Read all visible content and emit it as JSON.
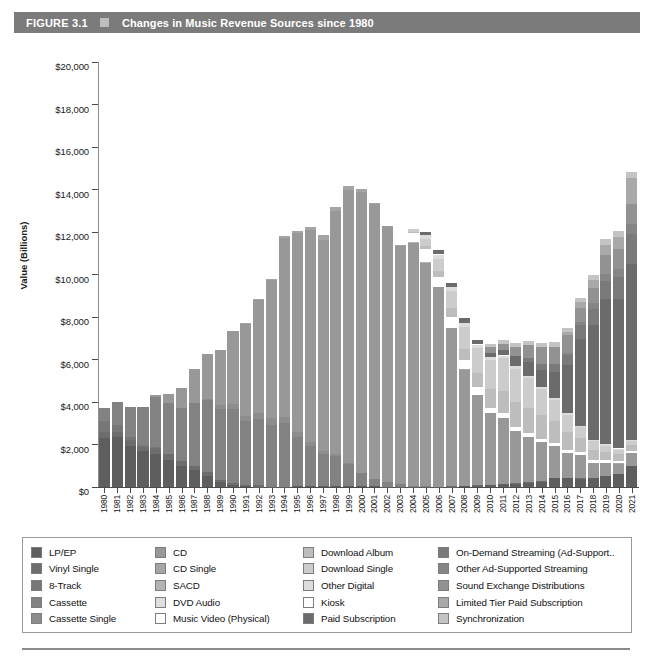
{
  "header": {
    "figure_number": "FIGURE 3.1",
    "bullet_icon": "square-bullet-icon",
    "title": "Changes in Music Revenue Sources since 1980",
    "bar_color": "#7b7b7b",
    "text_color": "#ffffff"
  },
  "legend": {
    "columns": [
      {
        "items": [
          {
            "label": "LP/EP",
            "color": "#5e5e5e"
          },
          {
            "label": "Vinyl Single",
            "color": "#6d6d6d"
          },
          {
            "label": "8-Track",
            "color": "#777777"
          },
          {
            "label": "Cassette",
            "color": "#828282"
          },
          {
            "label": "Cassette Single",
            "color": "#8d8d8d"
          }
        ]
      },
      {
        "items": [
          {
            "label": "CD",
            "color": "#989898"
          },
          {
            "label": "CD Single",
            "color": "#a5a5a5"
          },
          {
            "label": "SACD",
            "color": "#b3b3b3"
          },
          {
            "label": "DVD Audio",
            "color": "#dedede"
          },
          {
            "label": "Music Video (Physical)",
            "color": "#ffffff"
          }
        ]
      },
      {
        "items": [
          {
            "label": "Download Album",
            "color": "#bdbdbd"
          },
          {
            "label": "Download Single",
            "color": "#cccccc"
          },
          {
            "label": "Other Digital",
            "color": "#dcdcdc"
          },
          {
            "label": "Kiosk",
            "color": "#fdfdfd"
          },
          {
            "label": "Paid Subscription",
            "color": "#6b6b6b"
          }
        ]
      },
      {
        "items": [
          {
            "label": "On-Demand Streaming (Ad-Support..",
            "color": "#7a7a7a"
          },
          {
            "label": "Other Ad-Supported Streaming",
            "color": "#858585"
          },
          {
            "label": "Sound Exchange Distributions",
            "color": "#929292"
          },
          {
            "label": "Limited Tier Paid Subscription",
            "color": "#a9a9a9"
          },
          {
            "label": "Synchronization",
            "color": "#c4c4c4"
          }
        ]
      }
    ]
  },
  "chart_data": {
    "type": "bar",
    "stacked": true,
    "title": "Changes in Music Revenue Sources since 1980",
    "xlabel": "",
    "ylabel": "Value (Billions)",
    "ylim": [
      0,
      20000
    ],
    "ytick_labels": [
      "$20,000",
      "$18,000",
      "$16,000",
      "$14,000",
      "$12,000",
      "$10,000",
      "$8,000",
      "$6,000",
      "$4,000",
      "$2,000",
      "$0"
    ],
    "ytick_values": [
      20000,
      18000,
      16000,
      14000,
      12000,
      10000,
      8000,
      6000,
      4000,
      2000,
      0
    ],
    "grid": false,
    "legend_position": "below",
    "categories": [
      "1980",
      "1981",
      "1982",
      "1983",
      "1984",
      "1985",
      "1986",
      "1987",
      "1988",
      "1989",
      "1990",
      "1991",
      "1992",
      "1993",
      "1994",
      "1995",
      "1996",
      "1997",
      "1998",
      "1999",
      "2000",
      "2001",
      "2002",
      "2003",
      "2004",
      "2005",
      "2006",
      "2007",
      "2008",
      "2009",
      "2010",
      "2011",
      "2012",
      "2013",
      "2014",
      "2015",
      "2016",
      "2017",
      "2018",
      "2019",
      "2020",
      "2021"
    ],
    "totals": [
      3700,
      4000,
      3750,
      3900,
      4400,
      4400,
      4900,
      5600,
      6400,
      6500,
      7500,
      7600,
      9050,
      10100,
      12150,
      12450,
      12500,
      12200,
      13700,
      14700,
      14350,
      13800,
      12700,
      11900,
      12500,
      11900,
      11200,
      9700,
      8400,
      7700,
      6750,
      7000,
      7000,
      6900,
      6800,
      6800,
      7600,
      8600,
      9800,
      11200,
      12300,
      15100
    ],
    "series": [
      {
        "name": "LP/EP",
        "color": "#5e5e5e",
        "values": [
          2300,
          2340,
          1925,
          1690,
          1550,
          1280,
          983,
          793,
          532,
          220,
          87,
          30,
          14,
          11,
          18,
          25,
          36,
          26,
          34,
          32,
          28,
          28,
          21,
          22,
          19,
          14,
          16,
          23,
          57,
          70,
          86,
          119,
          163,
          211,
          258,
          422,
          430,
          399,
          435,
          504,
          620,
          1000
        ]
      },
      {
        "name": "Vinyl Single",
        "color": "#6d6d6d",
        "values": [
          280,
          256,
          283,
          187,
          298,
          281,
          228,
          203,
          180,
          116,
          94,
          66,
          66,
          10,
          6,
          10,
          9,
          8,
          7,
          6,
          4,
          3,
          2,
          2,
          2,
          2,
          2,
          2,
          2,
          2,
          3,
          3,
          3,
          3,
          4,
          4,
          4,
          4,
          4,
          4,
          4,
          5
        ]
      },
      {
        "name": "8-Track",
        "color": "#777777",
        "values": [
          526,
          320,
          150,
          80,
          15,
          5,
          0,
          0,
          0,
          0,
          0,
          0,
          0,
          0,
          0,
          0,
          0,
          0,
          0,
          0,
          0,
          0,
          0,
          0,
          0,
          0,
          0,
          0,
          0,
          0,
          0,
          0,
          0,
          0,
          0,
          0,
          0,
          0,
          0,
          0,
          0,
          0
        ]
      },
      {
        "name": "Cassette",
        "color": "#828282",
        "values": [
          604,
          1062,
          1385,
          1810,
          2384,
          2412,
          2500,
          2960,
          3385,
          3346,
          3472,
          3020,
          3116,
          2916,
          2976,
          2304,
          1905,
          1523,
          1420,
          1062,
          626,
          363,
          210,
          108,
          24,
          13,
          3,
          4,
          0,
          0,
          0,
          0,
          0,
          0,
          0,
          0,
          0,
          0,
          0,
          0,
          0,
          0
        ]
      },
      {
        "name": "Cassette Single",
        "color": "#8d8d8d",
        "values": [
          0,
          0,
          0,
          0,
          0,
          0,
          0,
          0,
          57,
          195,
          257,
          230,
          298,
          299,
          274,
          236,
          190,
          134,
          95,
          48,
          14,
          5,
          2,
          0,
          0,
          0,
          0,
          0,
          0,
          0,
          0,
          0,
          0,
          0,
          0,
          0,
          0,
          0,
          0,
          0,
          0,
          0
        ]
      },
      {
        "name": "CD",
        "color": "#989898",
        "values": [
          0,
          0,
          0,
          0,
          103,
          390,
          930,
          1593,
          2090,
          2588,
          3452,
          4338,
          5327,
          6511,
          8465,
          9377,
          9935,
          9915,
          11416,
          12816,
          13215,
          12909,
          12044,
          11233,
          11447,
          10520,
          9373,
          7452,
          5471,
          4273,
          3382,
          3130,
          2466,
          2123,
          1850,
          1485,
          1171,
          1099,
          698,
          615,
          483,
          584
        ]
      },
      {
        "name": "CD Single",
        "color": "#a5a5a5",
        "values": [
          0,
          0,
          0,
          0,
          0,
          0,
          0,
          0,
          0,
          0,
          0,
          36,
          45,
          45,
          56,
          110,
          184,
          272,
          213,
          221,
          143,
          79,
          24,
          20,
          15,
          11,
          5,
          3,
          2,
          2,
          2,
          2,
          2,
          2,
          2,
          2,
          2,
          2,
          2,
          2,
          2,
          2
        ]
      },
      {
        "name": "SACD",
        "color": "#b3b3b3",
        "values": [
          0,
          0,
          0,
          0,
          0,
          0,
          0,
          0,
          0,
          0,
          0,
          0,
          0,
          0,
          0,
          0,
          0,
          0,
          0,
          0,
          0,
          0,
          5,
          20,
          28,
          20,
          14,
          10,
          6,
          4,
          2,
          2,
          2,
          2,
          2,
          2,
          2,
          2,
          2,
          2,
          2,
          2
        ]
      },
      {
        "name": "DVD Audio",
        "color": "#dedede",
        "values": [
          0,
          0,
          0,
          0,
          0,
          0,
          0,
          0,
          0,
          0,
          0,
          0,
          0,
          0,
          0,
          0,
          0,
          0,
          0,
          0,
          0,
          0,
          2,
          8,
          13,
          12,
          10,
          8,
          5,
          3,
          2,
          2,
          2,
          2,
          2,
          2,
          2,
          2,
          2,
          2,
          2,
          2
        ]
      },
      {
        "name": "Music Video (Physical)",
        "color": "#ffffff",
        "values": [
          0,
          0,
          0,
          0,
          0,
          0,
          0,
          0,
          0,
          0,
          0,
          0,
          157,
          213,
          231,
          220,
          236,
          323,
          508,
          376,
          281,
          329,
          236,
          369,
          391,
          602,
          451,
          484,
          416,
          351,
          261,
          226,
          212,
          186,
          166,
          152,
          142,
          126,
          123,
          126,
          101,
          105
        ]
      },
      {
        "name": "Download Album",
        "color": "#bdbdbd",
        "values": [
          0,
          0,
          0,
          0,
          0,
          0,
          0,
          0,
          0,
          0,
          0,
          0,
          0,
          0,
          0,
          0,
          0,
          0,
          0,
          0,
          0,
          0,
          0,
          0,
          45,
          136,
          276,
          424,
          560,
          686,
          873,
          1026,
          1153,
          1173,
          1106,
          1023,
          848,
          654,
          500,
          400,
          320,
          280
        ]
      },
      {
        "name": "Download Single",
        "color": "#cccccc",
        "values": [
          0,
          0,
          0,
          0,
          0,
          0,
          0,
          0,
          0,
          0,
          0,
          0,
          0,
          0,
          0,
          0,
          0,
          0,
          0,
          0,
          0,
          0,
          0,
          0,
          140,
          363,
          565,
          809,
          1031,
          1154,
          1358,
          1550,
          1560,
          1436,
          1221,
          1027,
          786,
          538,
          390,
          300,
          230,
          200
        ]
      },
      {
        "name": "Other Digital",
        "color": "#dcdcdc",
        "values": [
          0,
          0,
          0,
          0,
          0,
          0,
          0,
          0,
          0,
          0,
          0,
          0,
          0,
          0,
          0,
          0,
          0,
          0,
          0,
          0,
          0,
          0,
          0,
          0,
          21,
          148,
          227,
          188,
          176,
          162,
          140,
          130,
          123,
          110,
          98,
          90,
          80,
          70,
          62,
          58,
          52,
          50
        ]
      },
      {
        "name": "Kiosk",
        "color": "#fdfdfd",
        "values": [
          0,
          0,
          0,
          0,
          0,
          0,
          0,
          0,
          0,
          0,
          0,
          0,
          0,
          0,
          0,
          0,
          0,
          0,
          0,
          0,
          0,
          0,
          0,
          0,
          2,
          5,
          8,
          10,
          12,
          9,
          6,
          4,
          3,
          2,
          2,
          1,
          1,
          1,
          1,
          1,
          1,
          1
        ]
      },
      {
        "name": "Paid Subscription",
        "color": "#6b6b6b",
        "values": [
          0,
          0,
          0,
          0,
          0,
          0,
          0,
          0,
          0,
          0,
          0,
          0,
          0,
          0,
          0,
          0,
          0,
          0,
          0,
          0,
          0,
          0,
          0,
          0,
          0,
          149,
          205,
          201,
          201,
          212,
          212,
          241,
          462,
          628,
          799,
          1219,
          2258,
          4053,
          5416,
          6825,
          7022,
          8280
        ]
      },
      {
        "name": "On-Demand Streaming (Ad-Support..",
        "color": "#7a7a7a",
        "values": [
          0,
          0,
          0,
          0,
          0,
          0,
          0,
          0,
          0,
          0,
          0,
          0,
          0,
          0,
          0,
          0,
          0,
          0,
          0,
          0,
          0,
          0,
          0,
          0,
          0,
          0,
          0,
          0,
          0,
          0,
          0,
          0,
          0,
          220,
          295,
          385,
          469,
          659,
          760,
          856,
          1037,
          1380
        ]
      },
      {
        "name": "Other Ad-Supported Streaming",
        "color": "#858585",
        "values": [
          0,
          0,
          0,
          0,
          0,
          0,
          0,
          0,
          0,
          0,
          0,
          0,
          0,
          0,
          0,
          0,
          0,
          0,
          0,
          0,
          0,
          0,
          0,
          0,
          0,
          0,
          0,
          0,
          0,
          0,
          0,
          0,
          0,
          0,
          0,
          0,
          100,
          180,
          250,
          310,
          370,
          470
        ]
      },
      {
        "name": "Sound Exchange Distributions",
        "color": "#929292",
        "values": [
          0,
          0,
          0,
          0,
          0,
          0,
          0,
          0,
          0,
          0,
          0,
          0,
          0,
          0,
          0,
          0,
          0,
          0,
          0,
          0,
          0,
          0,
          0,
          0,
          0,
          0,
          0,
          0,
          0,
          0,
          249,
          292,
          462,
          590,
          773,
          803,
          884,
          652,
          720,
          910,
          940,
          980
        ]
      },
      {
        "name": "Limited Tier Paid Subscription",
        "color": "#a9a9a9",
        "values": [
          0,
          0,
          0,
          0,
          0,
          0,
          0,
          0,
          0,
          0,
          0,
          0,
          0,
          0,
          0,
          0,
          0,
          0,
          0,
          0,
          0,
          0,
          0,
          0,
          0,
          0,
          0,
          0,
          0,
          0,
          0,
          0,
          0,
          0,
          0,
          0,
          100,
          250,
          390,
          480,
          590,
          1200
        ]
      },
      {
        "name": "Synchronization",
        "color": "#c4c4c4",
        "values": [
          0,
          0,
          0,
          0,
          0,
          0,
          0,
          0,
          0,
          0,
          0,
          0,
          0,
          0,
          0,
          0,
          0,
          0,
          0,
          0,
          0,
          0,
          0,
          0,
          0,
          0,
          0,
          0,
          0,
          0,
          183,
          192,
          187,
          184,
          190,
          200,
          220,
          230,
          240,
          260,
          280,
          300
        ]
      }
    ]
  }
}
